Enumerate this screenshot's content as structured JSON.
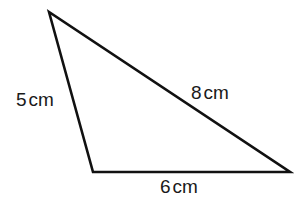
{
  "diagram": {
    "type": "triangle",
    "stroke_color": "#111111",
    "background": "#ffffff",
    "vertices": {
      "top": [
        49,
        12
      ],
      "bottom_left": [
        93,
        172
      ],
      "bottom_right": [
        290,
        172
      ]
    },
    "sides": [
      {
        "id": "left",
        "value": "5",
        "unit": "cm"
      },
      {
        "id": "hypotenuse",
        "value": "8",
        "unit": "cm"
      },
      {
        "id": "bottom",
        "value": "6",
        "unit": "cm"
      }
    ]
  }
}
